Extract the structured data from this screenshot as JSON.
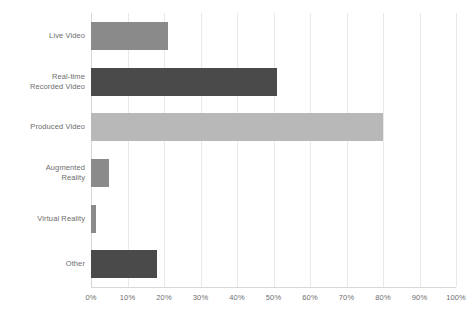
{
  "chart_data": {
    "type": "bar",
    "orientation": "horizontal",
    "title": "",
    "xlabel": "",
    "ylabel": "",
    "categories": [
      "Live Video",
      "Real-time Recorded Video",
      "Produced Video",
      "Augmented Reality",
      "Virtual Reality",
      "Other"
    ],
    "category_label_lines": [
      [
        "Live Video"
      ],
      [
        "Real-time",
        "Recorded Video"
      ],
      [
        "Produced Video"
      ],
      [
        "Augmented",
        "Reality"
      ],
      [
        "Virtual Reality"
      ],
      [
        "Other"
      ]
    ],
    "values": [
      21,
      51,
      80,
      5,
      1.5,
      18
    ],
    "value_unit": "%",
    "bar_colors": [
      "#8a8a8a",
      "#4a4a4a",
      "#b8b8b8",
      "#8a8a8a",
      "#8a8a8a",
      "#4a4a4a"
    ],
    "xlim": [
      0,
      100
    ],
    "xticks": [
      0,
      10,
      20,
      30,
      40,
      50,
      60,
      70,
      80,
      90,
      100
    ],
    "xtick_labels": [
      "0%",
      "10%",
      "20%",
      "30%",
      "40%",
      "50%",
      "60%",
      "70%",
      "80%",
      "90%",
      "100%"
    ],
    "grid": true,
    "grid_axis": "x",
    "legend": false,
    "background_color": "#ffffff",
    "gridline_color": "#e9e9e9",
    "axis_color": "#d8d8d8",
    "label_color": "#6e6e6e"
  }
}
